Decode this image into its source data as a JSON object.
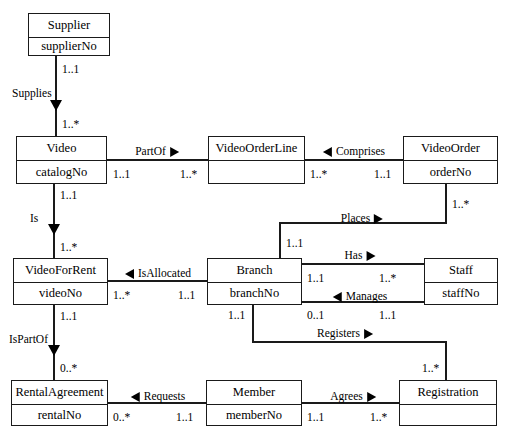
{
  "diagram": {
    "stroke_color": "#1a1a1a",
    "background_color": "#ffffff"
  },
  "entities": [
    {
      "id": "supplier",
      "name": "Supplier",
      "attribute": "supplierNo",
      "x": 28,
      "y": 13,
      "w": 82,
      "h": 43
    },
    {
      "id": "video",
      "name": "Video",
      "attribute": "catalogNo",
      "x": 16,
      "y": 136,
      "w": 91,
      "h": 48
    },
    {
      "id": "videoorderline",
      "name": "VideoOrderLine",
      "attribute": "",
      "x": 208,
      "y": 136,
      "w": 97,
      "h": 48
    },
    {
      "id": "videoorder",
      "name": "VideoOrder",
      "attribute": "orderNo",
      "x": 403,
      "y": 136,
      "w": 95,
      "h": 48
    },
    {
      "id": "videoforrent",
      "name": "VideoForRent",
      "attribute": "videoNo",
      "x": 13,
      "y": 258,
      "w": 95,
      "h": 47
    },
    {
      "id": "branch",
      "name": "Branch",
      "attribute": "branchNo",
      "x": 207,
      "y": 258,
      "w": 95,
      "h": 47
    },
    {
      "id": "staff",
      "name": "Staff",
      "attribute": "staffNo",
      "x": 424,
      "y": 258,
      "w": 74,
      "h": 47
    },
    {
      "id": "rentalagreement",
      "name": "RentalAgreement",
      "attribute": "rentalNo",
      "x": 11,
      "y": 380,
      "w": 97,
      "h": 46
    },
    {
      "id": "member",
      "name": "Member",
      "attribute": "memberNo",
      "x": 206,
      "y": 380,
      "w": 96,
      "h": 46
    },
    {
      "id": "registration",
      "name": "Registration",
      "attribute": "",
      "x": 399,
      "y": 380,
      "w": 98,
      "h": 46
    }
  ],
  "relationships": [
    {
      "id": "supplies",
      "label": "Supplies",
      "direction": "down",
      "from": "supplier",
      "to": "video",
      "from_mult": "1..1",
      "to_mult": "1..*"
    },
    {
      "id": "partof",
      "label": "PartOf",
      "direction": "right",
      "from": "video",
      "to": "videoorderline",
      "from_mult": "1..1",
      "to_mult": "1..*"
    },
    {
      "id": "comprises",
      "label": "Comprises",
      "direction": "left",
      "from": "videoorder",
      "to": "videoorderline",
      "from_mult": "1..1",
      "to_mult": "1..*"
    },
    {
      "id": "is",
      "label": "Is",
      "direction": "down",
      "from": "video",
      "to": "videoforrent",
      "from_mult": "1..1",
      "to_mult": "1..*"
    },
    {
      "id": "places",
      "label": "Places",
      "direction": "right",
      "from": "branch",
      "to": "videoorder",
      "from_mult": "1..1",
      "to_mult": "1..*"
    },
    {
      "id": "isallocated",
      "label": "IsAllocated",
      "direction": "left",
      "from": "branch",
      "to": "videoforrent",
      "from_mult": "1..1",
      "to_mult": "1..*"
    },
    {
      "id": "has",
      "label": "Has",
      "direction": "right",
      "from": "branch",
      "to": "staff",
      "from_mult": "1..1",
      "to_mult": "1..*"
    },
    {
      "id": "manages",
      "label": "Manages",
      "direction": "left",
      "from": "staff",
      "to": "branch",
      "from_mult": "1..1",
      "to_mult": "0..1"
    },
    {
      "id": "ispartof",
      "label": "IsPartOf",
      "direction": "down",
      "from": "videoforrent",
      "to": "rentalagreement",
      "from_mult": "1..1",
      "to_mult": "0..*"
    },
    {
      "id": "registers",
      "label": "Registers",
      "direction": "right",
      "from": "branch",
      "to": "registration",
      "from_mult": "1..1",
      "to_mult": "1..*"
    },
    {
      "id": "requests",
      "label": "Requests",
      "direction": "left",
      "from": "member",
      "to": "rentalagreement",
      "from_mult": "1..1",
      "to_mult": "0..*"
    },
    {
      "id": "agrees",
      "label": "Agrees",
      "direction": "right",
      "from": "member",
      "to": "registration",
      "from_mult": "1..1",
      "to_mult": "1..*"
    }
  ],
  "multiplicity_markers": [
    {
      "id": "supplier-supplies",
      "text": "1..1",
      "x": 62,
      "y": 64
    },
    {
      "id": "video-supplies",
      "text": "1..*",
      "x": 62,
      "y": 119
    },
    {
      "id": "video-partof",
      "text": "1..1",
      "x": 113,
      "y": 169
    },
    {
      "id": "videoorderline-partof",
      "text": "1..*",
      "x": 180,
      "y": 169
    },
    {
      "id": "videoorderline-comprises",
      "text": "1..*",
      "x": 310,
      "y": 169
    },
    {
      "id": "videoorder-comprises",
      "text": "1..1",
      "x": 374,
      "y": 169
    },
    {
      "id": "video-is",
      "text": "1..1",
      "x": 60,
      "y": 190
    },
    {
      "id": "videoforrent-is",
      "text": "1..*",
      "x": 60,
      "y": 242
    },
    {
      "id": "videoorder-places",
      "text": "1..*",
      "x": 452,
      "y": 199
    },
    {
      "id": "branch-places",
      "text": "1..1",
      "x": 286,
      "y": 238
    },
    {
      "id": "videoforrent-isallocated",
      "text": "1..*",
      "x": 113,
      "y": 290
    },
    {
      "id": "branch-isallocated",
      "text": "1..1",
      "x": 178,
      "y": 290
    },
    {
      "id": "branch-has",
      "text": "1..1",
      "x": 307,
      "y": 273
    },
    {
      "id": "staff-has",
      "text": "1..*",
      "x": 379,
      "y": 273
    },
    {
      "id": "branch-manages",
      "text": "0..1",
      "x": 307,
      "y": 310
    },
    {
      "id": "staff-manages",
      "text": "1..1",
      "x": 379,
      "y": 310
    },
    {
      "id": "videoforrent-ispartof",
      "text": "1..1",
      "x": 60,
      "y": 311
    },
    {
      "id": "rentalagreement-ispartof",
      "text": "0..*",
      "x": 60,
      "y": 363
    },
    {
      "id": "branch-registers",
      "text": "1..1",
      "x": 228,
      "y": 310
    },
    {
      "id": "registration-registers",
      "text": "1..*",
      "x": 422,
      "y": 363
    },
    {
      "id": "rentalagreement-requests",
      "text": "0..*",
      "x": 113,
      "y": 412
    },
    {
      "id": "member-requests",
      "text": "1..1",
      "x": 176,
      "y": 412
    },
    {
      "id": "member-agrees",
      "text": "1..1",
      "x": 307,
      "y": 412
    },
    {
      "id": "registration-agrees",
      "text": "1..*",
      "x": 370,
      "y": 412
    }
  ],
  "relation_labels": [
    {
      "id": "supplies-label",
      "text": "Supplies",
      "x": 12,
      "y": 88,
      "marker": "none",
      "align": "left"
    },
    {
      "id": "is-label",
      "text": "Is",
      "x": 30,
      "y": 213,
      "marker": "none",
      "align": "left"
    },
    {
      "id": "ispartof-label",
      "text": "IsPartOf",
      "x": 9,
      "y": 334,
      "marker": "none",
      "align": "left"
    },
    {
      "id": "partof-label",
      "text": "PartOf",
      "x": 157,
      "y": 146,
      "marker": "triangle-right",
      "align": "center"
    },
    {
      "id": "comprises-label",
      "text": "Comprises",
      "x": 354,
      "y": 146,
      "marker": "triangle-left",
      "align": "center"
    },
    {
      "id": "places-label",
      "text": "Places",
      "x": 362,
      "y": 213,
      "marker": "triangle-right",
      "align": "center"
    },
    {
      "id": "isallocated-label",
      "text": "IsAllocated",
      "x": 158,
      "y": 268,
      "marker": "triangle-left",
      "align": "center"
    },
    {
      "id": "has-label",
      "text": "Has",
      "x": 360,
      "y": 250,
      "marker": "triangle-right",
      "align": "center"
    },
    {
      "id": "manages-label",
      "text": "Manages",
      "x": 360,
      "y": 291,
      "marker": "triangle-left",
      "align": "center"
    },
    {
      "id": "registers-label",
      "text": "Registers",
      "x": 345,
      "y": 328,
      "marker": "triangle-right",
      "align": "center"
    },
    {
      "id": "requests-label",
      "text": "Requests",
      "x": 158,
      "y": 391,
      "marker": "triangle-left",
      "align": "center"
    },
    {
      "id": "agrees-label",
      "text": "Agrees",
      "x": 353,
      "y": 391,
      "marker": "triangle-right",
      "align": "center"
    }
  ],
  "down_triangles": [
    {
      "id": "supplies-arrow",
      "x": 50,
      "y": 100
    },
    {
      "id": "is-arrow",
      "x": 48,
      "y": 224
    },
    {
      "id": "ispartof-arrow",
      "x": 48,
      "y": 345
    }
  ]
}
